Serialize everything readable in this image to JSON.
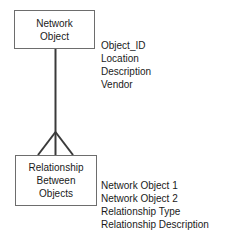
{
  "diagram": {
    "type": "entity-relationship-diagram",
    "background_color": "#ffffff",
    "line_color": "#3a3a3a",
    "border_color": "#6d6d6d",
    "text_color": "#1a1a1a",
    "entities": [
      {
        "id": "network-object",
        "title_lines": [
          "Network",
          "Object"
        ],
        "attributes": [
          "Object_ID",
          "Location",
          "Description",
          "Vendor"
        ]
      },
      {
        "id": "relationship-between-objects",
        "title_lines": [
          "Relationship",
          "Between",
          "Objects"
        ],
        "attributes": [
          "Network Object 1",
          "Network Object 2",
          "Relationship Type",
          "Relationship Description"
        ]
      }
    ],
    "connector": {
      "name": "one-to-many-crows-foot",
      "from": "network-object",
      "to": "relationship-between-objects",
      "cardinality_symbol": "crows-foot"
    }
  }
}
